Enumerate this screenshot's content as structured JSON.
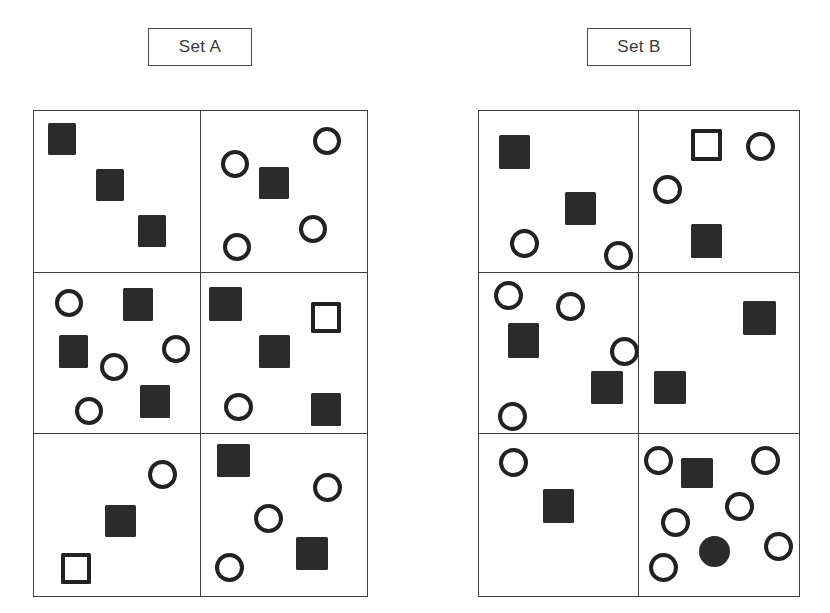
{
  "figure": {
    "width": 830,
    "height": 613,
    "background_color": "#ffffff",
    "shape_colors": {
      "filled": "#2b2b2b",
      "outline": "#222222",
      "panel_border": "#3f3f3f",
      "label_border": "#4a4a4a",
      "label_text": "#3a3a3a"
    }
  },
  "panels": [
    {
      "id": "set-a",
      "label": "Set A",
      "label_box": {
        "x": 148,
        "y": 28,
        "w": 104,
        "h": 38
      },
      "frame": {
        "x": 33,
        "y": 110,
        "w": 335,
        "h": 487
      },
      "columns": 2,
      "rows": 3,
      "cells": [
        {
          "id": "a-r1c1",
          "row": 1,
          "col": 1,
          "counts": {
            "square_filled": 3,
            "square_open": 0,
            "circle_open": 0,
            "circle_filled": 0
          },
          "shapes": [
            {
              "type": "square-filled",
              "x": 14,
              "y": 12,
              "w": 28,
              "h": 32
            },
            {
              "type": "square-filled",
              "x": 62,
              "y": 58,
              "w": 28,
              "h": 32
            },
            {
              "type": "square-filled",
              "x": 104,
              "y": 104,
              "w": 28,
              "h": 32
            }
          ]
        },
        {
          "id": "a-r1c2",
          "row": 1,
          "col": 2,
          "counts": {
            "square_filled": 1,
            "square_open": 0,
            "circle_open": 4,
            "circle_filled": 0
          },
          "shapes": [
            {
              "type": "circle-open",
              "x": 112,
              "y": 16,
              "w": 28,
              "h": 28
            },
            {
              "type": "circle-open",
              "x": 20,
              "y": 39,
              "w": 28,
              "h": 28
            },
            {
              "type": "square-filled",
              "x": 58,
              "y": 56,
              "w": 30,
              "h": 32
            },
            {
              "type": "circle-open",
              "x": 98,
              "y": 104,
              "w": 28,
              "h": 28
            },
            {
              "type": "circle-open",
              "x": 22,
              "y": 122,
              "w": 28,
              "h": 28
            }
          ]
        },
        {
          "id": "a-r2c1",
          "row": 2,
          "col": 1,
          "counts": {
            "square_filled": 3,
            "square_open": 0,
            "circle_open": 4,
            "circle_filled": 0
          },
          "shapes": [
            {
              "type": "circle-open",
              "x": 21,
              "y": 16,
              "w": 28,
              "h": 28
            },
            {
              "type": "square-filled",
              "x": 89,
              "y": 15,
              "w": 30,
              "h": 33
            },
            {
              "type": "square-filled",
              "x": 25,
              "y": 62,
              "w": 29,
              "h": 33
            },
            {
              "type": "circle-open",
              "x": 66,
              "y": 80,
              "w": 28,
              "h": 28
            },
            {
              "type": "circle-open",
              "x": 128,
              "y": 62,
              "w": 28,
              "h": 28
            },
            {
              "type": "circle-open",
              "x": 41,
              "y": 124,
              "w": 28,
              "h": 28
            },
            {
              "type": "square-filled",
              "x": 106,
              "y": 112,
              "w": 30,
              "h": 33
            }
          ]
        },
        {
          "id": "a-r2c2",
          "row": 2,
          "col": 2,
          "counts": {
            "square_filled": 4,
            "square_open": 1,
            "circle_open": 1,
            "circle_filled": 0
          },
          "shapes": [
            {
              "type": "square-filled",
              "x": 8,
              "y": 14,
              "w": 33,
              "h": 34
            },
            {
              "type": "square-open",
              "x": 110,
              "y": 29,
              "w": 30,
              "h": 31
            },
            {
              "type": "square-filled",
              "x": 58,
              "y": 62,
              "w": 31,
              "h": 33
            },
            {
              "type": "circle-open",
              "x": 23,
              "y": 120,
              "w": 29,
              "h": 28
            },
            {
              "type": "square-filled",
              "x": 110,
              "y": 120,
              "w": 30,
              "h": 33
            }
          ]
        },
        {
          "id": "a-r3c1",
          "row": 3,
          "col": 1,
          "counts": {
            "square_filled": 1,
            "square_open": 1,
            "circle_open": 1,
            "circle_filled": 0
          },
          "shapes": [
            {
              "type": "circle-open",
              "x": 114,
              "y": 26,
              "w": 29,
              "h": 29
            },
            {
              "type": "square-filled",
              "x": 71,
              "y": 71,
              "w": 31,
              "h": 32
            },
            {
              "type": "square-open",
              "x": 27,
              "y": 119,
              "w": 30,
              "h": 31
            }
          ]
        },
        {
          "id": "a-r3c2",
          "row": 3,
          "col": 2,
          "counts": {
            "square_filled": 2,
            "square_open": 0,
            "circle_open": 3,
            "circle_filled": 0
          },
          "shapes": [
            {
              "type": "square-filled",
              "x": 16,
              "y": 10,
              "w": 33,
              "h": 33
            },
            {
              "type": "circle-open",
              "x": 112,
              "y": 39,
              "w": 29,
              "h": 29
            },
            {
              "type": "circle-open",
              "x": 53,
              "y": 70,
              "w": 29,
              "h": 29
            },
            {
              "type": "square-filled",
              "x": 95,
              "y": 103,
              "w": 32,
              "h": 33
            },
            {
              "type": "circle-open",
              "x": 14,
              "y": 119,
              "w": 29,
              "h": 29
            }
          ]
        }
      ]
    },
    {
      "id": "set-b",
      "label": "Set B",
      "label_box": {
        "x": 587,
        "y": 28,
        "w": 104,
        "h": 38
      },
      "frame": {
        "x": 478,
        "y": 110,
        "w": 322,
        "h": 487
      },
      "columns": 2,
      "rows": 3,
      "cells": [
        {
          "id": "b-r1c1",
          "row": 1,
          "col": 1,
          "counts": {
            "square_filled": 2,
            "square_open": 0,
            "circle_open": 2,
            "circle_filled": 0
          },
          "shapes": [
            {
              "type": "square-filled",
              "x": 20,
              "y": 24,
              "w": 31,
              "h": 34
            },
            {
              "type": "square-filled",
              "x": 86,
              "y": 81,
              "w": 31,
              "h": 33
            },
            {
              "type": "circle-open",
              "x": 31,
              "y": 118,
              "w": 29,
              "h": 29
            },
            {
              "type": "circle-open",
              "x": 125,
              "y": 130,
              "w": 29,
              "h": 29
            }
          ]
        },
        {
          "id": "b-r1c2",
          "row": 1,
          "col": 2,
          "counts": {
            "square_filled": 1,
            "square_open": 1,
            "circle_open": 2,
            "circle_filled": 0
          },
          "shapes": [
            {
              "type": "square-open",
              "x": 52,
              "y": 18,
              "w": 31,
              "h": 32
            },
            {
              "type": "circle-open",
              "x": 107,
              "y": 21,
              "w": 29,
              "h": 29
            },
            {
              "type": "circle-open",
              "x": 14,
              "y": 64,
              "w": 29,
              "h": 29
            },
            {
              "type": "square-filled",
              "x": 52,
              "y": 113,
              "w": 31,
              "h": 34
            }
          ]
        },
        {
          "id": "b-r2c1",
          "row": 2,
          "col": 1,
          "counts": {
            "square_filled": 2,
            "square_open": 0,
            "circle_open": 4,
            "circle_filled": 0
          },
          "shapes": [
            {
              "type": "circle-open",
              "x": 15,
              "y": 8,
              "w": 29,
              "h": 29
            },
            {
              "type": "circle-open",
              "x": 77,
              "y": 19,
              "w": 29,
              "h": 29
            },
            {
              "type": "square-filled",
              "x": 29,
              "y": 50,
              "w": 31,
              "h": 35
            },
            {
              "type": "circle-open",
              "x": 131,
              "y": 64,
              "w": 29,
              "h": 29
            },
            {
              "type": "square-filled",
              "x": 112,
              "y": 98,
              "w": 32,
              "h": 33
            },
            {
              "type": "circle-open",
              "x": 19,
              "y": 129,
              "w": 29,
              "h": 29
            }
          ]
        },
        {
          "id": "b-r2c2",
          "row": 2,
          "col": 2,
          "counts": {
            "square_filled": 2,
            "square_open": 0,
            "circle_open": 0,
            "circle_filled": 0
          },
          "shapes": [
            {
              "type": "square-filled",
              "x": 104,
              "y": 28,
              "w": 33,
              "h": 34
            },
            {
              "type": "square-filled",
              "x": 15,
              "y": 98,
              "w": 32,
              "h": 33
            }
          ]
        },
        {
          "id": "b-r3c1",
          "row": 3,
          "col": 1,
          "counts": {
            "square_filled": 1,
            "square_open": 0,
            "circle_open": 1,
            "circle_filled": 0
          },
          "shapes": [
            {
              "type": "circle-open",
              "x": 20,
              "y": 14,
              "w": 29,
              "h": 29
            },
            {
              "type": "square-filled",
              "x": 64,
              "y": 55,
              "w": 31,
              "h": 34
            }
          ]
        },
        {
          "id": "b-r3c2",
          "row": 3,
          "col": 2,
          "counts": {
            "square_filled": 1,
            "square_open": 0,
            "circle_open": 6,
            "circle_filled": 1
          },
          "shapes": [
            {
              "type": "circle-open",
              "x": 5,
              "y": 12,
              "w": 29,
              "h": 29
            },
            {
              "type": "square-filled",
              "x": 42,
              "y": 24,
              "w": 32,
              "h": 30
            },
            {
              "type": "circle-open",
              "x": 112,
              "y": 12,
              "w": 29,
              "h": 29
            },
            {
              "type": "circle-open",
              "x": 86,
              "y": 58,
              "w": 29,
              "h": 29
            },
            {
              "type": "circle-open",
              "x": 22,
              "y": 74,
              "w": 29,
              "h": 29
            },
            {
              "type": "circle-open",
              "x": 125,
              "y": 98,
              "w": 29,
              "h": 29
            },
            {
              "type": "circle-filled",
              "x": 60,
              "y": 102,
              "w": 31,
              "h": 31
            },
            {
              "type": "circle-open",
              "x": 10,
              "y": 119,
              "w": 29,
              "h": 29
            }
          ]
        }
      ]
    }
  ]
}
